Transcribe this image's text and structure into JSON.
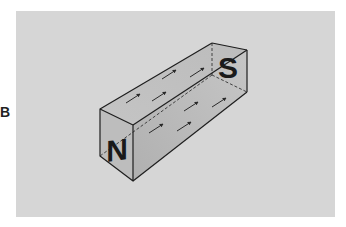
{
  "figure": {
    "panel_label": "B",
    "caption": "",
    "background_color": "#d6d6d6",
    "magnet": {
      "north_pole_label": "N",
      "south_pole_label": "S",
      "face_color_front": "#bdbdbd",
      "face_color_top": "#c9c9c9",
      "face_color_side": "#b4b4b4",
      "edge_color": "#1e1e1e",
      "arrow_direction": "toward N (south to north inside magnet)",
      "arrow_count": 10
    }
  }
}
